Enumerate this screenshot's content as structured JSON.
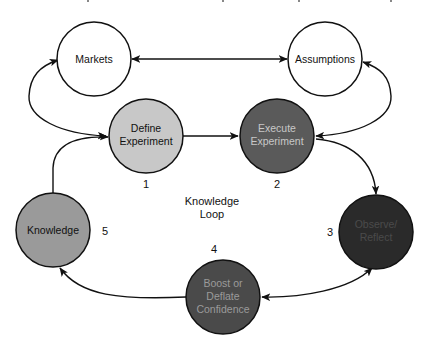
{
  "diagram": {
    "center_label": [
      "Knowledge",
      "Loop"
    ],
    "nodes": [
      {
        "id": "markets",
        "lines": [
          "Markets"
        ],
        "number": "",
        "fill": "#ffffff",
        "text_color": "#111111"
      },
      {
        "id": "assumptions",
        "lines": [
          "Assumptions"
        ],
        "number": "",
        "fill": "#ffffff",
        "text_color": "#111111"
      },
      {
        "id": "define-experiment",
        "lines": [
          "Define",
          "Experiment"
        ],
        "number": "1",
        "fill": "#c8c8c8",
        "text_color": "#111111"
      },
      {
        "id": "execute-experiment",
        "lines": [
          "Execute",
          "Experiment"
        ],
        "number": "2",
        "fill": "#5a5a5a",
        "text_color": "#d0d0d0"
      },
      {
        "id": "observe-reflect",
        "lines": [
          "Observe/",
          "Reflect"
        ],
        "number": "3",
        "fill": "#2a2a2a",
        "text_color": "#4a4a4a"
      },
      {
        "id": "boost-deflate-confidence",
        "lines": [
          "Boost or",
          "Deflate",
          "Confidence"
        ],
        "number": "4",
        "fill": "#4a4a4a",
        "text_color": "#9a9a9a"
      },
      {
        "id": "knowledge",
        "lines": [
          "Knowledge"
        ],
        "number": "5",
        "fill": "#9a9a9a",
        "text_color": "#111111"
      }
    ],
    "edges": [
      {
        "from": "markets",
        "to": "assumptions",
        "direction": "bidirectional"
      },
      {
        "from": "define-experiment",
        "to": "markets",
        "direction": "bidirectional"
      },
      {
        "from": "execute-experiment",
        "to": "assumptions",
        "direction": "bidirectional"
      },
      {
        "from": "define-experiment",
        "to": "execute-experiment",
        "direction": "forward"
      },
      {
        "from": "execute-experiment",
        "to": "observe-reflect",
        "direction": "forward"
      },
      {
        "from": "observe-reflect",
        "to": "boost-deflate-confidence",
        "direction": "bidirectional"
      },
      {
        "from": "boost-deflate-confidence",
        "to": "knowledge",
        "direction": "forward"
      },
      {
        "from": "knowledge",
        "to": "define-experiment",
        "direction": "forward"
      }
    ]
  }
}
